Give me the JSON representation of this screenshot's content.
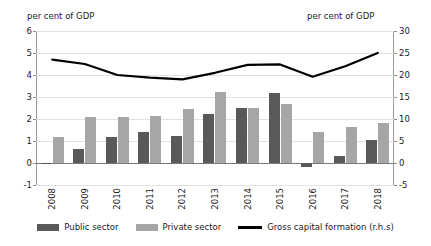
{
  "chart_data": {
    "type": "bar",
    "title": "",
    "subtitle": "",
    "xlabel": "",
    "ylabel": "per cent of GDP",
    "y2label": "per cent of GDP",
    "categories": [
      "2008",
      "2009",
      "2010",
      "2011",
      "2012",
      "2013",
      "2014",
      "2015",
      "2016",
      "2017",
      "2018"
    ],
    "ylim": [
      -1,
      6
    ],
    "yticks": [
      -1,
      0,
      1,
      2,
      3,
      4,
      5,
      6
    ],
    "y2lim": [
      -5,
      30
    ],
    "y2ticks": [
      -5,
      0,
      5,
      10,
      15,
      20,
      25,
      30
    ],
    "grid": true,
    "legend_position": "bottom",
    "series": [
      {
        "name": "Public sector",
        "type": "bar",
        "axis": "left",
        "color": "#595959",
        "values": [
          0.02,
          0.65,
          1.2,
          1.4,
          1.25,
          2.25,
          2.5,
          3.2,
          -0.2,
          0.3,
          1.05
        ]
      },
      {
        "name": "Private sector",
        "type": "bar",
        "axis": "left",
        "color": "#a6a6a6",
        "values": [
          1.2,
          2.1,
          2.1,
          2.15,
          2.45,
          3.25,
          2.5,
          2.7,
          1.4,
          1.65,
          1.8
        ]
      },
      {
        "name": "Gross capital formation (r.h.s)",
        "type": "line",
        "axis": "right",
        "color": "#000000",
        "values": [
          23.5,
          22.5,
          20.0,
          19.4,
          19.0,
          20.5,
          22.3,
          22.4,
          19.6,
          22.0,
          25.0
        ]
      }
    ]
  },
  "axes": {
    "left_title": "per cent of GDP",
    "right_title": "per cent of GDP",
    "left_ticks": [
      "6",
      "5",
      "4",
      "3",
      "2",
      "1",
      "0",
      "-1"
    ],
    "right_ticks": [
      "30",
      "25",
      "20",
      "15",
      "10",
      "5",
      "0",
      "-5"
    ],
    "x_ticks": [
      "2008",
      "2009",
      "2010",
      "2011",
      "2012",
      "2013",
      "2014",
      "2015",
      "2016",
      "2017",
      "2018"
    ]
  },
  "legend": {
    "items": [
      {
        "label": "Public sector",
        "marker": "bar-swatch-dark"
      },
      {
        "label": "Private sector",
        "marker": "bar-swatch-light"
      },
      {
        "label": "Gross capital formation (r.h.s)",
        "marker": "line-swatch"
      }
    ]
  }
}
